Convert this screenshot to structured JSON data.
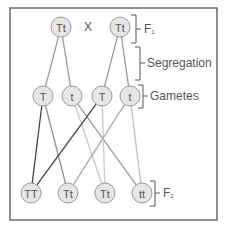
{
  "frame": {
    "x": 10,
    "y": 8,
    "w": 207,
    "h": 212,
    "stroke": "#444444"
  },
  "style": {
    "circle_fill": "#e6e6e6",
    "circle_stroke": "#999999",
    "text_color": "#555555"
  },
  "parents": {
    "cross_symbol": "X",
    "nodes": [
      {
        "id": "p1",
        "label": "Tt",
        "x": 61,
        "y": 27
      },
      {
        "id": "p2",
        "label": "Tt",
        "x": 120,
        "y": 27
      }
    ]
  },
  "gametes": {
    "nodes": [
      {
        "id": "g1",
        "label": "T",
        "x": 43,
        "y": 96
      },
      {
        "id": "g2",
        "label": "t",
        "x": 72,
        "y": 96
      },
      {
        "id": "g3",
        "label": "T",
        "x": 102,
        "y": 96
      },
      {
        "id": "g4",
        "label": "t",
        "x": 130,
        "y": 96
      }
    ]
  },
  "offspring": {
    "nodes": [
      {
        "id": "o1",
        "label": "TT",
        "x": 31,
        "y": 193
      },
      {
        "id": "o2",
        "label": "Tt",
        "x": 68,
        "y": 193
      },
      {
        "id": "o3",
        "label": "Tt",
        "x": 105,
        "y": 193
      },
      {
        "id": "o4",
        "label": "tt",
        "x": 142,
        "y": 193
      }
    ]
  },
  "edges": [
    {
      "from": "p1",
      "to": "g1",
      "color": "#9a9a9a"
    },
    {
      "from": "p1",
      "to": "g2",
      "color": "#9a9a9a"
    },
    {
      "from": "p2",
      "to": "g3",
      "color": "#9a9a9a"
    },
    {
      "from": "p2",
      "to": "g4",
      "color": "#9a9a9a"
    },
    {
      "from": "g1",
      "to": "o1",
      "color": "#444444"
    },
    {
      "from": "g1",
      "to": "o2",
      "color": "#8c8c8c"
    },
    {
      "from": "g2",
      "to": "o3",
      "color": "#c8c8c8"
    },
    {
      "from": "g2",
      "to": "o4",
      "color": "#9a9a9a"
    },
    {
      "from": "g3",
      "to": "o1",
      "color": "#444444"
    },
    {
      "from": "g3",
      "to": "o3",
      "color": "#c8c8c8"
    },
    {
      "from": "g4",
      "to": "o2",
      "color": "#a8a8a8"
    },
    {
      "from": "g4",
      "to": "o4",
      "color": "#c0c0c0"
    }
  ],
  "labels": {
    "f1": {
      "text": "F",
      "sub": "1"
    },
    "segregation": {
      "text": "Segregation"
    },
    "gametes": {
      "text": "Gametes"
    },
    "f2": {
      "text": "F",
      "sub": "2"
    }
  }
}
